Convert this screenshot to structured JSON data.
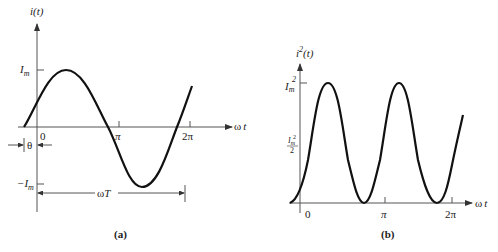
{
  "figure": {
    "panel_a": {
      "caption": "(a)",
      "y_axis_label": "i(t)",
      "x_axis_label": "ω t",
      "y_ticks": {
        "max": "I_m",
        "min": "−I_m"
      },
      "x_ticks": [
        "0",
        "π",
        "2π"
      ],
      "phase_label": "θ",
      "period_label": "ω T",
      "function": "i(t) = I_m sin(ωt + θ)"
    },
    "panel_b": {
      "caption": "(b)",
      "y_axis_label": "i²(t)",
      "x_axis_label": "ω t",
      "y_ticks": {
        "max": "I_m²",
        "mid": "I_m²/2"
      },
      "x_ticks": [
        "0",
        "π",
        "2π"
      ],
      "function": "i²(t) = I_m² sin²(ωt + θ)"
    }
  },
  "labels": {
    "a_ylabel_main": "i",
    "a_ylabel_arg": "(t)",
    "a_xlabel_omega": "ω",
    "a_xlabel_t": "t",
    "a_Im": "I",
    "a_Im_sub": "m",
    "a_negIm": "−I",
    "a_negIm_sub": "m",
    "a_zero": "0",
    "a_pi": "π",
    "a_2pi": "2π",
    "a_theta": "θ",
    "a_omegaT_omega": "ω",
    "a_omegaT_T": "T",
    "a_caption": "(a)",
    "b_ylabel_main": "i",
    "b_ylabel_sup": "2",
    "b_ylabel_arg": "(t)",
    "b_Im2": "I",
    "b_Im2_sub": "m",
    "b_Im2_sup": "2",
    "b_half_num_I": "I",
    "b_half_num_sub": "m",
    "b_half_num_sup": "2",
    "b_half_den": "2",
    "b_zero": "0",
    "b_pi": "π",
    "b_2pi": "2π",
    "b_xlabel_omega": "ω",
    "b_xlabel_t": "t",
    "b_caption": "(b)"
  }
}
